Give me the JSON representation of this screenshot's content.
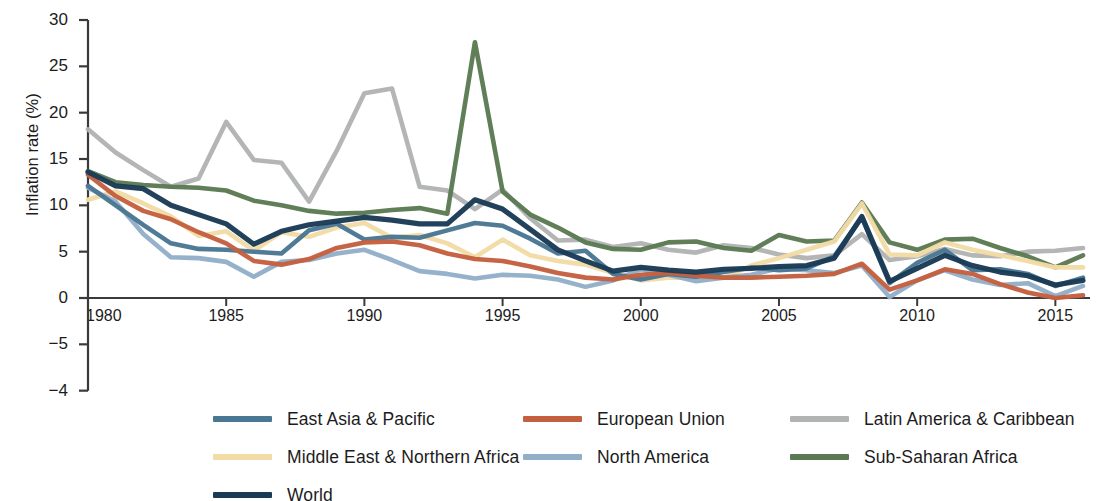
{
  "chart_data": {
    "type": "line",
    "title": "",
    "xlabel": "",
    "ylabel": "Inflation rate (%)",
    "xlim": [
      1980,
      2016
    ],
    "ylim": [
      -4,
      30
    ],
    "grid": false,
    "legend_position": "bottom",
    "x": [
      1980,
      1981,
      1982,
      1983,
      1984,
      1985,
      1986,
      1987,
      1988,
      1989,
      1990,
      1991,
      1992,
      1993,
      1994,
      1995,
      1996,
      1997,
      1998,
      1999,
      2000,
      2001,
      2002,
      2003,
      2004,
      2005,
      2006,
      2007,
      2008,
      2009,
      2010,
      2011,
      2012,
      2013,
      2014,
      2015,
      2016
    ],
    "xticks": [
      1980,
      1985,
      1990,
      1995,
      2000,
      2005,
      2010,
      2015
    ],
    "xtick_labels": [
      "1980",
      "1985",
      "1990",
      "1995",
      "2000",
      "2005",
      "2010",
      "2015"
    ],
    "yticks": [
      30,
      25,
      20,
      15,
      10,
      5,
      0,
      -5,
      -4
    ],
    "ytick_labels": [
      "30",
      "25",
      "20",
      "15",
      "10",
      "5",
      "0",
      "−5",
      "−4"
    ],
    "series": [
      {
        "name": "East Asia & Pacific",
        "color": "#4a7793",
        "values": [
          12.1,
          10.0,
          7.9,
          5.9,
          5.3,
          5.2,
          5.0,
          4.8,
          7.3,
          8.0,
          6.3,
          6.6,
          6.5,
          7.3,
          8.1,
          7.8,
          6.4,
          4.8,
          5.1,
          2.6,
          2.0,
          2.6,
          2.3,
          2.8,
          3.3,
          3.0,
          3.2,
          4.5,
          8.7,
          1.6,
          3.8,
          5.2,
          3.0,
          3.1,
          2.6,
          1.3,
          2.2
        ]
      },
      {
        "name": "European Union",
        "color": "#c4603f",
        "values": [
          13.3,
          11.0,
          9.4,
          8.5,
          7.1,
          5.9,
          4.0,
          3.6,
          4.2,
          5.4,
          6.0,
          6.1,
          5.7,
          4.8,
          4.2,
          4.0,
          3.4,
          2.7,
          2.2,
          2.0,
          2.5,
          2.7,
          2.4,
          2.2,
          2.2,
          2.3,
          2.4,
          2.6,
          3.7,
          0.9,
          1.9,
          3.1,
          2.6,
          1.5,
          0.6,
          0.0,
          0.3
        ]
      },
      {
        "name": "Latin America & Caribbean",
        "color": "#b2b4b3",
        "values": [
          18.2,
          15.7,
          13.8,
          12.0,
          12.9,
          19.0,
          14.9,
          14.6,
          10.4,
          15.9,
          22.1,
          22.6,
          12.0,
          11.6,
          9.6,
          11.7,
          8.6,
          6.2,
          6.3,
          5.5,
          5.9,
          5.2,
          4.9,
          5.7,
          5.4,
          4.7,
          4.3,
          4.6,
          6.9,
          4.1,
          4.5,
          5.3,
          4.6,
          4.5,
          5.0,
          5.1,
          5.4
        ]
      },
      {
        "name": "Middle East & Northern Africa",
        "color": "#f2dba5",
        "values": [
          10.6,
          11.5,
          10.2,
          8.8,
          6.7,
          7.2,
          5.1,
          7.1,
          6.6,
          7.6,
          8.1,
          6.5,
          6.8,
          5.9,
          4.4,
          6.3,
          4.6,
          4.0,
          3.6,
          2.7,
          1.9,
          2.2,
          2.2,
          2.2,
          3.5,
          4.3,
          5.2,
          6.1,
          10.2,
          4.7,
          4.6,
          6.0,
          5.2,
          4.6,
          4.0,
          3.3,
          3.3
        ]
      },
      {
        "name": "North America",
        "color": "#93afc8",
        "values": [
          11.9,
          10.4,
          6.9,
          4.4,
          4.3,
          3.9,
          2.3,
          3.9,
          4.1,
          4.8,
          5.2,
          4.1,
          2.9,
          2.6,
          2.1,
          2.5,
          2.4,
          2.0,
          1.2,
          1.9,
          3.1,
          2.5,
          1.8,
          2.2,
          2.5,
          3.2,
          3.0,
          2.7,
          3.5,
          0.1,
          1.9,
          3.0,
          2.0,
          1.4,
          1.6,
          0.2,
          1.3
        ]
      },
      {
        "name": "Sub-Saharan Africa",
        "color": "#5b7a53",
        "values": [
          13.7,
          12.5,
          12.2,
          12.0,
          11.9,
          11.6,
          10.5,
          10.0,
          9.4,
          9.1,
          9.2,
          9.5,
          9.7,
          9.1,
          27.6,
          11.5,
          9.0,
          7.6,
          6.0,
          5.3,
          5.2,
          6.0,
          6.1,
          5.4,
          5.1,
          6.8,
          6.1,
          6.2,
          10.3,
          6.0,
          5.2,
          6.3,
          6.4,
          5.4,
          4.5,
          3.3,
          4.6
        ]
      },
      {
        "name": "World",
        "color": "#1b3b55",
        "values": [
          13.6,
          12.1,
          11.8,
          10.0,
          9.0,
          8.0,
          5.8,
          7.2,
          7.9,
          8.3,
          8.7,
          8.4,
          8.0,
          8.0,
          10.6,
          9.6,
          7.4,
          5.2,
          4.0,
          2.9,
          3.3,
          3.0,
          2.8,
          3.1,
          3.2,
          3.4,
          3.5,
          4.3,
          8.8,
          1.8,
          3.2,
          4.6,
          3.5,
          2.8,
          2.4,
          1.4,
          1.9
        ]
      }
    ]
  },
  "axis": {
    "y_title": "Inflation rate (%)"
  },
  "legend": {
    "rows": [
      [
        {
          "label": "East Asia & Pacific",
          "color": "#4a7793",
          "icon": "line-swatch-icon"
        },
        {
          "label": "European Union",
          "color": "#c4603f",
          "icon": "line-swatch-icon"
        },
        {
          "label": "Latin America & Caribbean",
          "color": "#b2b4b3",
          "icon": "line-swatch-icon"
        }
      ],
      [
        {
          "label": "Middle East & Northern Africa",
          "color": "#f2dba5",
          "icon": "line-swatch-icon"
        },
        {
          "label": "North America",
          "color": "#93afc8",
          "icon": "line-swatch-icon"
        },
        {
          "label": "Sub-Saharan Africa",
          "color": "#5b7a53",
          "icon": "line-swatch-icon"
        }
      ],
      [
        {
          "label": "World",
          "color": "#1b3b55",
          "icon": "line-swatch-icon"
        }
      ]
    ]
  }
}
